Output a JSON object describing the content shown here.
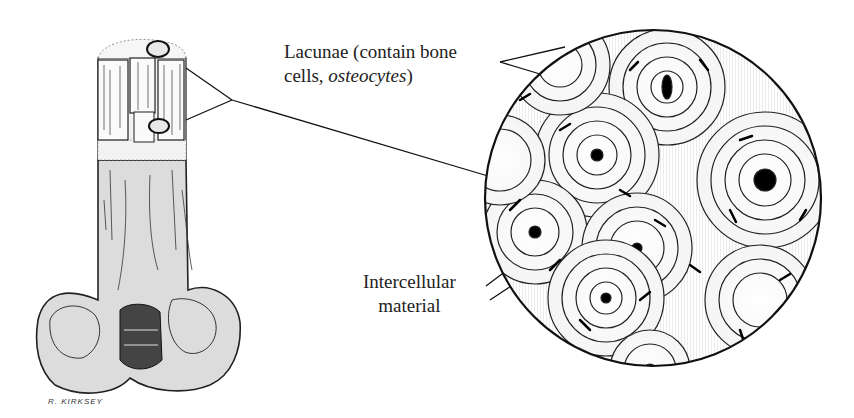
{
  "figure": {
    "labels": {
      "lacunae": {
        "line1": "Lacunae (contain bone",
        "line2_prefix": "cells, ",
        "line2_italic": "osteocytes",
        "line2_suffix": ")"
      },
      "intercellular": {
        "line1": "Intercellular",
        "line2": "material"
      }
    },
    "signature": "R. KIRKSEY"
  },
  "colors": {
    "bone_fill": "#dcdcdc",
    "ink": "#1a1a1a",
    "background": "#ffffff"
  }
}
